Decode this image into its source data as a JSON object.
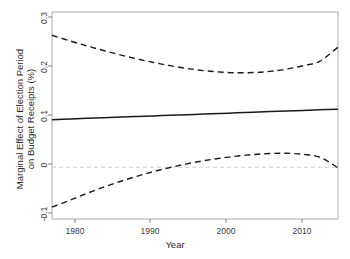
{
  "figure": {
    "clipped_header_text": "",
    "background_color": "#ffffff",
    "line_color": "#1a1a1a",
    "zero_line_color": "#d0d0d0"
  },
  "axes": {
    "xlabel": "Year",
    "ylabel_line1": "Marginal Effect of Election Period",
    "ylabel_line2": "on Budget Receipts (%)",
    "xticks": [
      "1980",
      "1990",
      "2000",
      "2010"
    ],
    "yticks": [
      "0.3",
      "0.2",
      "0.1",
      "0",
      "-0.1"
    ]
  },
  "chart_data": {
    "type": "line",
    "title": "",
    "xlabel": "Year",
    "ylabel": "Marginal Effect of Election Period on Budget Receipts (%)",
    "xlim": [
      1977.8,
      2012.2
    ],
    "ylim": [
      -0.1,
      0.3
    ],
    "xticks": [
      1980,
      1990,
      2000,
      2010
    ],
    "yticks": [
      -0.1,
      0,
      0.1,
      0.2,
      0.3
    ],
    "grid": false,
    "legend": "none",
    "annotations": [
      {
        "text": "zero reference line",
        "y": 0,
        "style": "dashed",
        "color": "#d0d0d0"
      }
    ],
    "x": [
      1977.8,
      1980,
      1982,
      1984,
      1986,
      1988,
      1990,
      1992,
      1994,
      1996,
      1998,
      2000,
      2002,
      2004,
      2006,
      2008,
      2010,
      2012.2
    ],
    "series": [
      {
        "name": "Marginal effect (point estimate)",
        "style": "solid",
        "color": "#1a1a1a",
        "values": [
          0.092,
          0.0933,
          0.0945,
          0.0957,
          0.0969,
          0.098,
          0.0992,
          0.1004,
          0.1016,
          0.1027,
          0.1039,
          0.1051,
          0.1063,
          0.1075,
          0.1086,
          0.1098,
          0.111,
          0.1123
        ]
      },
      {
        "name": "Upper 95% confidence bound",
        "style": "dashed",
        "color": "#1a1a1a",
        "values": [
          0.255,
          0.244,
          0.2345,
          0.2256,
          0.2172,
          0.2095,
          0.2025,
          0.1963,
          0.191,
          0.1868,
          0.184,
          0.1826,
          0.183,
          0.1853,
          0.1897,
          0.1962,
          0.2048,
          0.232
        ]
      },
      {
        "name": "Lower 95% confidence bound",
        "style": "dashed",
        "color": "#1a1a1a",
        "values": [
          -0.077,
          -0.0635,
          -0.0505,
          -0.0385,
          -0.0275,
          -0.0175,
          -0.0085,
          -0.0005,
          0.0065,
          0.0125,
          0.0175,
          0.0215,
          0.0245,
          0.0265,
          0.027,
          0.025,
          0.0195,
          -0.001
        ]
      }
    ]
  }
}
